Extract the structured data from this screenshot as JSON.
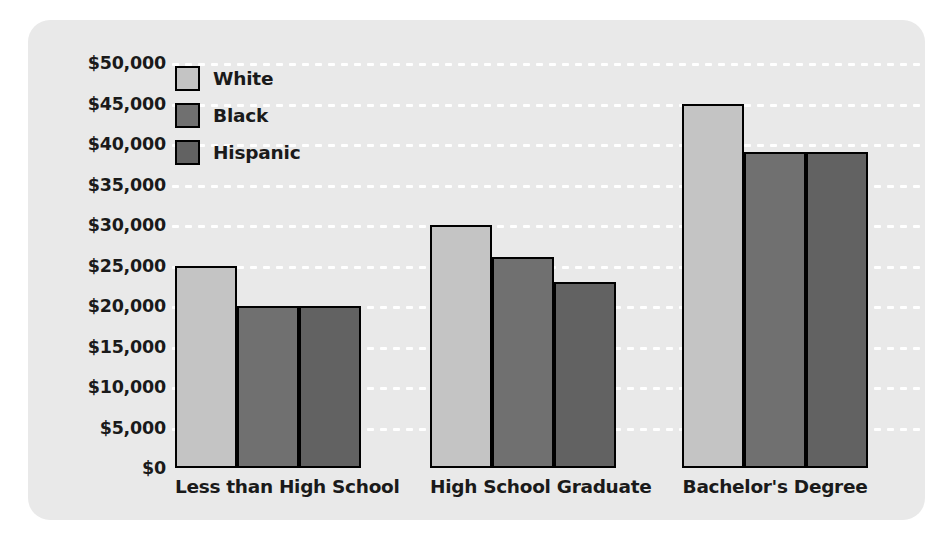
{
  "chart_data": {
    "type": "bar",
    "title": "",
    "xlabel": "",
    "ylabel": "",
    "categories": [
      "Less than High School",
      "High School Graduate",
      "Bachelor's Degree"
    ],
    "series": [
      {
        "name": "White",
        "color": "#c4c4c4",
        "values": [
          25000,
          30000,
          45000
        ]
      },
      {
        "name": "Black",
        "color": "#707070",
        "values": [
          20000,
          26000,
          39000
        ]
      },
      {
        "name": "Hispanic",
        "color": "#626262",
        "values": [
          20000,
          23000,
          39000
        ]
      }
    ],
    "ylim": [
      0,
      50000
    ],
    "ytick_step": 5000,
    "yticks": [
      "$0",
      "$5,000",
      "$10,000",
      "$15,000",
      "$20,000",
      "$25,000",
      "$30,000",
      "$35,000",
      "$40,000",
      "$45,000",
      "$50,000"
    ],
    "ytick_values": [
      0,
      5000,
      10000,
      15000,
      20000,
      25000,
      30000,
      35000,
      40000,
      45000,
      50000
    ],
    "grid": true,
    "grid_style": "dotted-white-horizontal",
    "legend_position": "top-left-inside",
    "bar_outline_color": "#000000",
    "panel_color": "#e9e9e9",
    "background_color": "#ffffff"
  }
}
